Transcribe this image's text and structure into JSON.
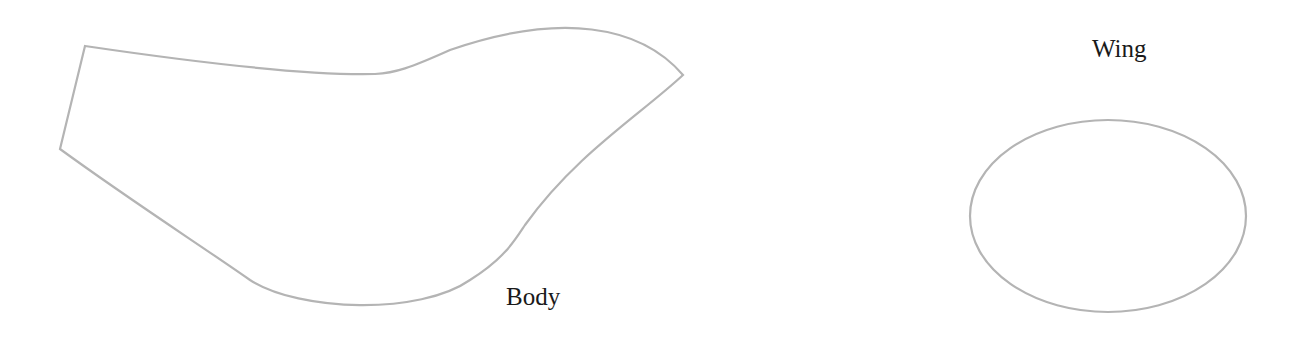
{
  "diagram": {
    "parts": [
      {
        "id": "body",
        "label": "Body",
        "shape": "bird-body-outline"
      },
      {
        "id": "wing",
        "label": "Wing",
        "shape": "ellipse"
      }
    ],
    "colors": {
      "outline": "#b4b4b4",
      "text": "#1a1a1a",
      "background": "#ffffff"
    }
  }
}
